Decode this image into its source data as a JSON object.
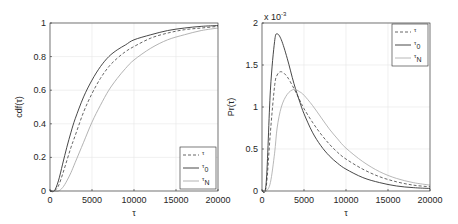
{
  "chart_data": [
    {
      "type": "line",
      "title": "",
      "xlabel": "τ",
      "ylabel": "cdf(τ)",
      "xlim": [
        0,
        20000
      ],
      "ylim": [
        0,
        1
      ],
      "xticks": [
        0,
        5000,
        10000,
        15000,
        20000
      ],
      "xtick_labels": [
        "0",
        "5000",
        "10000",
        "15000",
        "20000"
      ],
      "yticks": [
        0,
        0.2,
        0.4,
        0.6,
        0.8,
        1
      ],
      "ytick_labels": [
        "0",
        "0.2",
        "0.4",
        "0.6",
        "0.8",
        "1"
      ],
      "grid": true,
      "legend_position": "lower right",
      "x": [
        0,
        500,
        1000,
        1500,
        2000,
        2500,
        3000,
        4000,
        5000,
        6000,
        7000,
        8000,
        9000,
        10000,
        12000,
        14000,
        16000,
        18000,
        20000
      ],
      "series": [
        {
          "name": "τ",
          "style": "dashed",
          "color": "#555555",
          "values": [
            0,
            0.0,
            0.03,
            0.1,
            0.18,
            0.26,
            0.33,
            0.47,
            0.58,
            0.67,
            0.74,
            0.79,
            0.83,
            0.86,
            0.91,
            0.94,
            0.96,
            0.97,
            0.98
          ]
        },
        {
          "name": "τ0",
          "style": "solid",
          "color": "#333333",
          "values": [
            0,
            0.0,
            0.06,
            0.16,
            0.26,
            0.35,
            0.43,
            0.56,
            0.66,
            0.74,
            0.8,
            0.84,
            0.87,
            0.9,
            0.93,
            0.955,
            0.97,
            0.98,
            0.985
          ]
        },
        {
          "name": "τN",
          "style": "solid",
          "color": "#aaaaaa",
          "values": [
            0,
            0.0,
            0.0,
            0.02,
            0.06,
            0.11,
            0.17,
            0.29,
            0.41,
            0.51,
            0.6,
            0.67,
            0.73,
            0.78,
            0.85,
            0.9,
            0.93,
            0.955,
            0.97
          ]
        }
      ]
    },
    {
      "type": "line",
      "title": "",
      "xlabel": "τ",
      "ylabel": "Pr(τ)",
      "y_multiplier_label": "x 10",
      "y_multiplier_exp": "-3",
      "xlim": [
        0,
        20000
      ],
      "ylim": [
        0,
        0.002
      ],
      "xticks": [
        0,
        5000,
        10000,
        15000,
        20000
      ],
      "xtick_labels": [
        "0",
        "5000",
        "10000",
        "15000",
        "20000"
      ],
      "yticks": [
        0,
        0.0005,
        0.001,
        0.0015,
        0.002
      ],
      "ytick_labels": [
        "0",
        "0.5",
        "1",
        "1.5",
        "2"
      ],
      "grid": true,
      "legend_position": "upper right",
      "x": [
        0,
        500,
        1000,
        1500,
        1800,
        2300,
        3000,
        3800,
        4500,
        5000,
        6000,
        7000,
        8000,
        9000,
        10000,
        12000,
        14000,
        16000,
        18000,
        20000
      ],
      "series": [
        {
          "name": "τ",
          "style": "dashed",
          "color": "#555555",
          "values": [
            0,
            5e-05,
            0.0007,
            0.00125,
            0.00138,
            0.00142,
            0.00136,
            0.00122,
            0.00108,
            0.00098,
            0.00082,
            0.00068,
            0.00056,
            0.00046,
            0.00038,
            0.00026,
            0.00017,
            0.00011,
            7e-05,
            5e-05
          ]
        },
        {
          "name": "τ0",
          "style": "solid",
          "color": "#333333",
          "values": [
            0,
            0.0001,
            0.0012,
            0.00178,
            0.00187,
            0.0018,
            0.00158,
            0.00128,
            0.00106,
            0.00092,
            0.0007,
            0.00054,
            0.00042,
            0.00033,
            0.00026,
            0.00016,
            0.0001,
            6e-05,
            4e-05,
            3e-05
          ]
        },
        {
          "name": "τN",
          "style": "solid",
          "color": "#b0b0b0",
          "values": [
            0,
            0.0,
            0.0001,
            0.00045,
            0.00075,
            0.001,
            0.00115,
            0.00121,
            0.00118,
            0.00114,
            0.00102,
            0.00088,
            0.00074,
            0.00062,
            0.00051,
            0.00035,
            0.00023,
            0.00015,
            0.0001,
            7e-05
          ]
        }
      ]
    }
  ]
}
